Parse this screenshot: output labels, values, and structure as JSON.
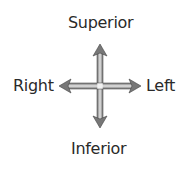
{
  "diagram": {
    "labels": {
      "top": "Superior",
      "bottom": "Inferior",
      "left_side": "Right",
      "right_side": "Left"
    },
    "arrow_color": "#7a7a7a",
    "arrow_highlight": "#e8e8e8"
  }
}
